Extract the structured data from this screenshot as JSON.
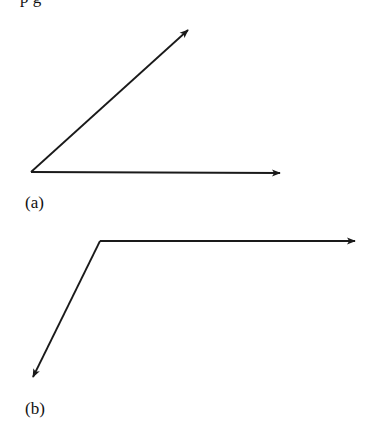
{
  "top_text_fragment": "p        g",
  "figures": [
    {
      "id": "a",
      "label": "(a)",
      "vectors": [
        {
          "from": [
            31,
            172
          ],
          "to": [
            188,
            30
          ],
          "direction": "up-right"
        },
        {
          "from": [
            31,
            172
          ],
          "to": [
            280,
            173
          ],
          "direction": "right"
        }
      ]
    },
    {
      "id": "b",
      "label": "(b)",
      "vectors": [
        {
          "from": [
            100,
            241
          ],
          "to": [
            355,
            241
          ],
          "direction": "right"
        },
        {
          "from": [
            100,
            241
          ],
          "to": [
            33,
            377
          ],
          "direction": "down-left"
        }
      ]
    }
  ],
  "colors": {
    "stroke": "#1a1a1a",
    "background": "#ffffff"
  }
}
